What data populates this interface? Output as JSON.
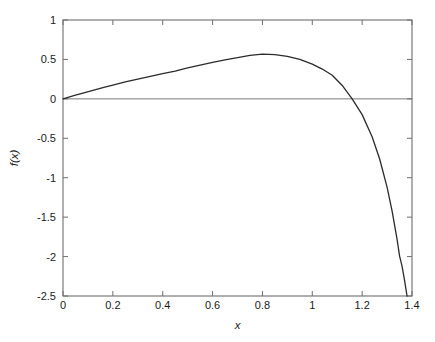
{
  "chart_data": {
    "type": "line",
    "title": "",
    "xlabel": "x",
    "ylabel": "f(x)",
    "xlim": [
      0,
      1.4
    ],
    "ylim": [
      -2.5,
      1
    ],
    "grid": false,
    "legend": null,
    "xticks": [
      0,
      0.2,
      0.4,
      0.6,
      0.8,
      1,
      1.2,
      1.4
    ],
    "xtick_labels": [
      "0",
      "0.2",
      "0.4",
      "0.6",
      "0.8",
      "1",
      "1.2",
      "1.4"
    ],
    "yticks": [
      1,
      0.5,
      0,
      -0.5,
      -1,
      -1.5,
      -2,
      -2.5
    ],
    "ytick_labels": [
      "1",
      "0.5",
      "0",
      "-0.5",
      "-1",
      "-1.5",
      "-2",
      "-2.5"
    ],
    "series": [
      {
        "name": "f(x)",
        "color": "#2b2b2b",
        "width": 1.3,
        "x": [
          0,
          0.02,
          0.05,
          0.08,
          0.12,
          0.16,
          0.2,
          0.25,
          0.3,
          0.35,
          0.4,
          0.45,
          0.5,
          0.55,
          0.6,
          0.65,
          0.7,
          0.75,
          0.8,
          0.85,
          0.9,
          0.95,
          1.0,
          1.04,
          1.08,
          1.12,
          1.16,
          1.2,
          1.24,
          1.27,
          1.3,
          1.32,
          1.34,
          1.35,
          1.36,
          1.37,
          1.375,
          1.38
        ],
        "y": [
          0,
          0.019,
          0.047,
          0.074,
          0.109,
          0.143,
          0.175,
          0.214,
          0.251,
          0.286,
          0.32,
          0.352,
          0.393,
          0.429,
          0.462,
          0.494,
          0.524,
          0.551,
          0.566,
          0.562,
          0.54,
          0.5,
          0.44,
          0.378,
          0.3,
          0.17,
          0.0,
          -0.2,
          -0.48,
          -0.76,
          -1.12,
          -1.42,
          -1.78,
          -1.99,
          -2.12,
          -2.3,
          -2.4,
          -2.5
        ]
      },
      {
        "name": "zero-line",
        "color": "#6b6b6b",
        "width": 0.9,
        "x": [
          0,
          1.4
        ],
        "y": [
          0,
          0
        ]
      }
    ],
    "axes": {
      "box": true,
      "tick_direction": "in",
      "frame_color": "#6e6e6e"
    }
  }
}
